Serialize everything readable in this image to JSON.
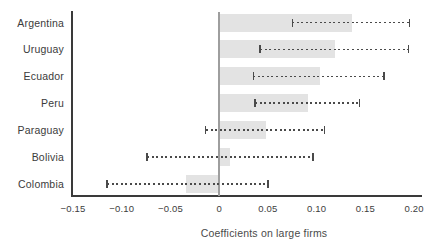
{
  "chart_data": {
    "type": "bar",
    "orientation": "horizontal",
    "title": "",
    "xlabel": "Coefficients on large firms",
    "ylabel": "",
    "categories": [
      "Argentina",
      "Uruguay",
      "Ecuador",
      "Peru",
      "Paraguay",
      "Bolivia",
      "Colombia"
    ],
    "values": [
      0.136,
      0.119,
      0.103,
      0.091,
      0.048,
      0.011,
      -0.034
    ],
    "ci_low": [
      0.075,
      0.042,
      0.035,
      0.037,
      -0.014,
      -0.074,
      -0.115
    ],
    "ci_high": [
      0.195,
      0.194,
      0.169,
      0.144,
      0.108,
      0.096,
      0.05
    ],
    "xlim": [
      -0.151,
      0.207
    ],
    "xticks": [
      -0.15,
      -0.1,
      -0.05,
      0,
      0.05,
      0.1,
      0.15,
      0.2
    ],
    "xtick_labels": [
      "−0.15",
      "−0.10",
      "−0.05",
      "0",
      "0.05",
      "0.10",
      "0.15",
      "0.20"
    ],
    "grid": false,
    "legend": null,
    "error_bar_style": "dashed-with-caps",
    "colors": {
      "bar": "#e3e3e3",
      "error_bar": "#4a4a4a",
      "zero_line": "#9e9e9e",
      "axis_line": "#3a3a3a",
      "tick_label": "#3d3d3d",
      "category_label": "#3b3b3b",
      "axis_title": "#4a4a4a",
      "background": "#ffffff"
    }
  }
}
